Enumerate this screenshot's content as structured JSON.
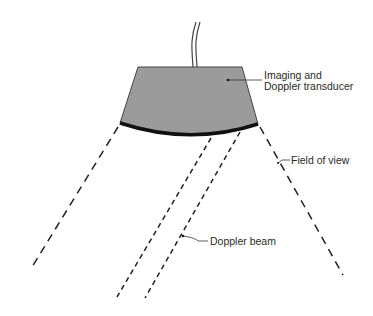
{
  "diagram": {
    "labels": {
      "transducer_line1": "Imaging and",
      "transducer_line2": "Doppler transducer",
      "field_of_view": "Field of view",
      "doppler_beam": "Doppler beam"
    },
    "colors": {
      "transducer_fill": "#9b9b9b",
      "outline": "#333333",
      "face": "#111111",
      "dashed": "#222222",
      "text": "#2a2a2a"
    }
  }
}
